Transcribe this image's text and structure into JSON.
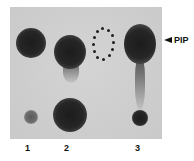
{
  "figure": {
    "type": "TLC autoradiograph",
    "marker_label": "PIP",
    "marker_icon": "arrowhead-left-icon",
    "lanes": [
      {
        "label": "1",
        "upper_spot": "strong",
        "lower_spot": "weak"
      },
      {
        "label": "2",
        "upper_spot": "strong with streak",
        "lower_spot": "strong"
      },
      {
        "label": "",
        "upper_spot": "dotted outline (absent)",
        "lower_spot": "none"
      },
      {
        "label": "3",
        "upper_spot": "strong with long streak",
        "lower_spot": "moderate"
      }
    ]
  },
  "colors": {
    "plate": "#cfcfcf",
    "spot": "#1c1c1c",
    "text": "#111111"
  }
}
